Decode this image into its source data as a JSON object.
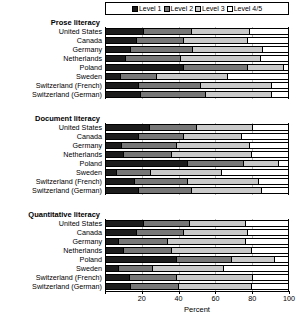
{
  "legend": {
    "items": [
      {
        "label": "Level 1",
        "color": "#1c1c1c",
        "key": "l1"
      },
      {
        "label": "Level 2",
        "color": "#777777",
        "key": "l2"
      },
      {
        "label": "Level 3",
        "color": "#cacaca",
        "key": "l3"
      },
      {
        "label": "Level 4/5",
        "color": "#ffffff",
        "key": "l4"
      }
    ]
  },
  "axis": {
    "title": "Percent",
    "ticks": [
      {
        "value": 0,
        "label": ""
      },
      {
        "value": 20,
        "label": "20"
      },
      {
        "value": 40,
        "label": "40"
      },
      {
        "value": 60,
        "label": "60"
      },
      {
        "value": 80,
        "label": "80"
      },
      {
        "value": 100,
        "label": "100"
      }
    ]
  },
  "chart_data": {
    "type": "bar",
    "orientation": "horizontal",
    "stacked": true,
    "title": "",
    "xlabel": "Percent",
    "ylabel": "",
    "xlim": [
      0,
      100
    ],
    "grid": true,
    "legend_position": "top",
    "series": [
      {
        "name": "Level 1",
        "color": "#1c1c1c"
      },
      {
        "name": "Level 2",
        "color": "#777777"
      },
      {
        "name": "Level 3",
        "color": "#cacaca"
      },
      {
        "name": "Level 4/5",
        "color": "#ffffff"
      }
    ],
    "categories": [
      "United States",
      "Canada",
      "Germany",
      "Netherlands",
      "Poland",
      "Sweden",
      "Switzerland (French)",
      "Switzerland (German)"
    ],
    "panels": [
      {
        "title": "Prose literacy",
        "categories": [
          "United States",
          "Canada",
          "Germany",
          "Netherlands",
          "Poland",
          "Sweden",
          "Switzerland (French)",
          "Switzerland (German)"
        ],
        "values": [
          [
            21,
            26,
            32,
            21
          ],
          [
            17,
            26,
            35,
            22
          ],
          [
            14,
            34,
            38,
            14
          ],
          [
            11,
            30,
            44,
            15
          ],
          [
            43,
            35,
            20,
            2
          ],
          [
            8,
            20,
            39,
            33
          ],
          [
            18,
            34,
            39,
            9
          ],
          [
            19,
            36,
            36,
            9
          ]
        ]
      },
      {
        "title": "Document literacy",
        "categories": [
          "United States",
          "Canada",
          "Germany",
          "Netherlands",
          "Poland",
          "Sweden",
          "Switzerland (French)",
          "Switzerland (German)"
        ],
        "values": [
          [
            24,
            26,
            31,
            19
          ],
          [
            18,
            25,
            32,
            25
          ],
          [
            9,
            30,
            40,
            21
          ],
          [
            10,
            26,
            44,
            20
          ],
          [
            45,
            31,
            19,
            5
          ],
          [
            6,
            19,
            39,
            36
          ],
          [
            16,
            29,
            39,
            16
          ],
          [
            18,
            29,
            39,
            14
          ]
        ]
      },
      {
        "title": "Quantitative literacy",
        "categories": [
          "United States",
          "Canada",
          "Germany",
          "Netherlands",
          "Poland",
          "Sweden",
          "Switzerland (French)",
          "Switzerland (German)"
        ],
        "values": [
          [
            21,
            25,
            31,
            23
          ],
          [
            17,
            26,
            35,
            22
          ],
          [
            7,
            27,
            43,
            23
          ],
          [
            10,
            26,
            44,
            20
          ],
          [
            39,
            30,
            24,
            7
          ],
          [
            7,
            19,
            39,
            35
          ],
          [
            13,
            26,
            42,
            19
          ],
          [
            14,
            26,
            40,
            20
          ]
        ]
      }
    ]
  }
}
